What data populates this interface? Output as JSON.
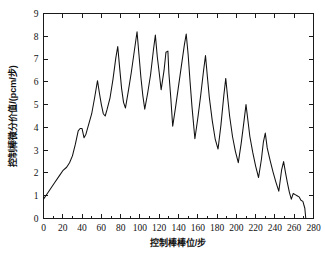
{
  "chart_data": {
    "type": "line",
    "title": "",
    "subtitle": "",
    "xlabel": "控制棒棒位/步",
    "ylabel": "控制棒微分价值/(pcm/步)",
    "xlim": [
      0,
      280
    ],
    "ylim": [
      0,
      9
    ],
    "xticks": [
      0,
      20,
      40,
      60,
      80,
      100,
      120,
      140,
      160,
      180,
      200,
      220,
      240,
      260,
      280
    ],
    "yticks": [
      0,
      1,
      2,
      3,
      4,
      5,
      6,
      7,
      8,
      9
    ],
    "xtick_labels": [
      "0",
      "20",
      "40",
      "60",
      "80",
      "100",
      "120",
      "140",
      "160",
      "180",
      "200",
      "220",
      "240",
      "260",
      "280"
    ],
    "ytick_labels": [
      "0",
      "1",
      "2",
      "3",
      "4",
      "5",
      "6",
      "7",
      "8",
      "9"
    ],
    "x_minor_tick_step": 10,
    "grid": false,
    "legend": null,
    "legend_position": "none",
    "line_color": "#111111",
    "axis_color": "#1a1a1a",
    "background_color": "#ffffff",
    "series": [
      {
        "name": "控制棒微分价值",
        "x": [
          0,
          4,
          8,
          12,
          16,
          20,
          24,
          27,
          30,
          33,
          36,
          38,
          40,
          42,
          44,
          47,
          50,
          53,
          56,
          58,
          60,
          62,
          64,
          66,
          69,
          72,
          75,
          77,
          79,
          81,
          83,
          85,
          88,
          91,
          94,
          97,
          99,
          101,
          103,
          105,
          108,
          111,
          114,
          116,
          118,
          120,
          122,
          125,
          127,
          129,
          130,
          132,
          134,
          137,
          140,
          143,
          146,
          148,
          150,
          152,
          154,
          157,
          160,
          163,
          166,
          168,
          170,
          172,
          175,
          178,
          181,
          184,
          187,
          189,
          191,
          193,
          196,
          199,
          202,
          205,
          208,
          210,
          212,
          214,
          217,
          220,
          223,
          226,
          228,
          230,
          232,
          235,
          238,
          241,
          244,
          247,
          249,
          251,
          253,
          255,
          257,
          259,
          261,
          263,
          265,
          267,
          269,
          271,
          272
        ],
        "y": [
          0.85,
          1.1,
          1.35,
          1.6,
          1.85,
          2.1,
          2.25,
          2.45,
          2.75,
          3.25,
          3.85,
          3.95,
          3.95,
          3.55,
          3.7,
          4.15,
          4.6,
          5.3,
          6.05,
          5.5,
          5.0,
          4.6,
          4.5,
          4.8,
          5.3,
          6.1,
          7.05,
          7.55,
          6.6,
          5.7,
          5.1,
          4.85,
          5.6,
          6.4,
          7.3,
          8.2,
          7.2,
          6.2,
          5.4,
          4.8,
          5.5,
          6.3,
          7.4,
          8.05,
          7.1,
          6.4,
          5.65,
          6.5,
          7.3,
          7.35,
          6.4,
          5.3,
          4.05,
          4.9,
          5.8,
          6.7,
          7.6,
          8.1,
          7.2,
          6.0,
          4.9,
          3.5,
          4.4,
          5.4,
          6.5,
          7.15,
          6.2,
          5.3,
          4.3,
          3.5,
          3.05,
          4.1,
          5.4,
          6.15,
          5.3,
          4.5,
          3.6,
          2.95,
          2.45,
          3.3,
          4.3,
          5.0,
          4.3,
          3.6,
          2.9,
          2.3,
          1.8,
          2.6,
          3.35,
          3.75,
          3.1,
          2.55,
          2.05,
          1.6,
          1.2,
          2.15,
          2.5,
          2.0,
          1.55,
          1.15,
          0.85,
          1.1,
          1.05,
          1.0,
          0.95,
          0.8,
          0.75,
          0.45,
          0.0
        ]
      }
    ],
    "peaks": [
      {
        "x": 38,
        "y": 3.95
      },
      {
        "x": 56,
        "y": 6.05
      },
      {
        "x": 77,
        "y": 7.55
      },
      {
        "x": 97,
        "y": 8.2
      },
      {
        "x": 116,
        "y": 8.05
      },
      {
        "x": 129,
        "y": 7.35
      },
      {
        "x": 148,
        "y": 8.1
      },
      {
        "x": 168,
        "y": 7.15
      },
      {
        "x": 189,
        "y": 6.15
      },
      {
        "x": 210,
        "y": 5.0
      },
      {
        "x": 230,
        "y": 3.75
      },
      {
        "x": 249,
        "y": 2.5
      }
    ],
    "valleys": [
      {
        "x": 42,
        "y": 3.55
      },
      {
        "x": 64,
        "y": 4.5
      },
      {
        "x": 85,
        "y": 4.85
      },
      {
        "x": 105,
        "y": 4.8
      },
      {
        "x": 122,
        "y": 5.65
      },
      {
        "x": 134,
        "y": 4.05
      },
      {
        "x": 157,
        "y": 3.5
      },
      {
        "x": 181,
        "y": 3.05
      },
      {
        "x": 202,
        "y": 2.45
      },
      {
        "x": 223,
        "y": 1.8
      },
      {
        "x": 244,
        "y": 1.2
      },
      {
        "x": 261,
        "y": 0.85
      },
      {
        "x": 272,
        "y": 0.0
      }
    ],
    "start_point": {
      "x": 0,
      "y": 0.85
    },
    "end_point": {
      "x": 272,
      "y": 0.0
    },
    "max_value": 8.2,
    "min_value": 0.0
  }
}
